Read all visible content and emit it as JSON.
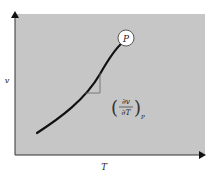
{
  "diagram": {
    "x_axis_label": "T",
    "y_axis_label": "v",
    "point_label": "P",
    "slope_label": {
      "numerator": "∂v",
      "denominator": "∂T",
      "subscript": "P"
    },
    "colors": {
      "panel": "#c6c6c6",
      "curve": "#111111",
      "axes": "#333333",
      "triangle": "#666666",
      "point_fill": "#ffffff"
    }
  }
}
